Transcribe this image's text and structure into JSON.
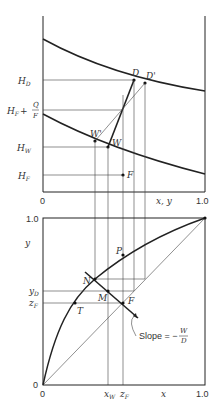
{
  "upper_plot": {
    "x_axis": {
      "label": "x, y",
      "tick_start": "0",
      "tick_end": "1.0"
    },
    "y_labels": {
      "H_D": {
        "main": "H",
        "sub": "D"
      },
      "H_F_plus_Q_over_F": {
        "main": "H",
        "sub": "F",
        "plus": "+",
        "num": "Q",
        "den": "F"
      },
      "H_W": {
        "main": "H",
        "sub": "W"
      },
      "H_F": {
        "main": "H",
        "sub": "F"
      }
    },
    "points": {
      "D": "D",
      "D_prime": "D'",
      "W": "W",
      "W_prime": "W'",
      "F": "F"
    }
  },
  "lower_plot": {
    "y_axis": {
      "label": "y",
      "tick_top": "1.0",
      "tick_zero": "0"
    },
    "x_axis": {
      "label": "x",
      "tick_start": "0",
      "tick_end": "1.0"
    },
    "y_labels": {
      "y_D": {
        "main": "y",
        "sub": "D"
      },
      "z_F": {
        "main": "z",
        "sub": "F"
      }
    },
    "x_labels": {
      "x_W": {
        "main": "x",
        "sub": "W"
      },
      "z_F": {
        "main": "z",
        "sub": "F"
      }
    },
    "points": {
      "N": "N",
      "M": "M",
      "F": "F",
      "T": "T",
      "P": "P"
    },
    "annotation": {
      "prefix": "Slope = −",
      "num": "W",
      "den": "D"
    }
  }
}
